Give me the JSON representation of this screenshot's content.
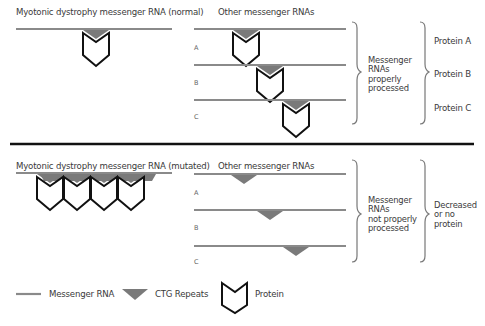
{
  "top_panel": {
    "left_title": "Myotonic dystrophy messenger RNA (normal)",
    "right_title": "Other messenger RNAs",
    "row_labels": [
      "A",
      "B",
      "C"
    ],
    "bracket1_label": "Messenger RNAs properly processed",
    "bracket1_lines": [
      "Messenger",
      "RNAs",
      "properly",
      "processed"
    ],
    "outcomes": [
      "Protein A",
      "Protein B",
      "Protein C"
    ]
  },
  "bottom_panel": {
    "left_title": "Myotonic dystrophy messenger RNA (mutated)",
    "right_title": "Other messenger RNAs",
    "row_labels": [
      "A",
      "B",
      "C"
    ],
    "bracket1_lines": [
      "Messenger",
      "RNAs",
      "not properly",
      "processed"
    ],
    "bracket2_lines": [
      "Decreased",
      "or no",
      "protein"
    ]
  },
  "legend": {
    "items": [
      {
        "icon": "messenger-rna-line",
        "label": "Messenger RNA"
      },
      {
        "icon": "ctg-repeat-triangle",
        "label": "CTG Repeats"
      },
      {
        "icon": "protein-chevron",
        "label": "Protein"
      }
    ]
  },
  "colors": {
    "rna_line": "#8a8a8a",
    "ctg_repeat": "#7a7a7a",
    "protein_stroke": "#111111",
    "divider": "#111111",
    "bracket": "#777777",
    "text": "#3a3a3a"
  }
}
